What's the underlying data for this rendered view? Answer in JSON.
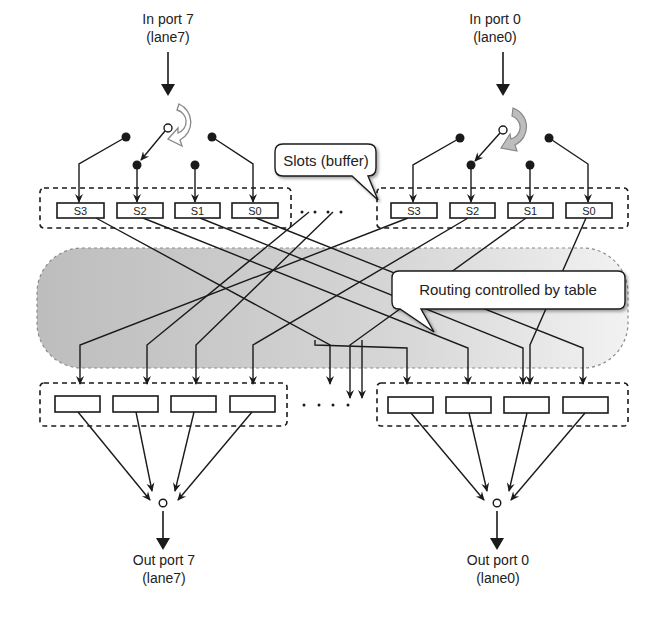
{
  "colors": {
    "line": "#1a1a1a",
    "routing_region": "#c9c9c9",
    "routing_region_border": "#8a8a8a",
    "rotation_arrow_light": "#ffffff",
    "rotation_arrow_dark": "#bdbdbd",
    "callout_fill": "#ffffff"
  },
  "inputs": [
    {
      "id": "in7",
      "label_line1": "In port 7",
      "label_line2": "(lane7)",
      "rotation_arrow": "outline"
    },
    {
      "id": "in0",
      "label_line1": "In port 0",
      "label_line2": "(lane0)",
      "rotation_arrow": "filled"
    }
  ],
  "outputs": [
    {
      "id": "out7",
      "label_line1": "Out port 7",
      "label_line2": "(lane7)"
    },
    {
      "id": "out0",
      "label_line1": "Out port 0",
      "label_line2": "(lane0)"
    }
  ],
  "input_slots": {
    "left": [
      "S3",
      "S2",
      "S1",
      "S0"
    ],
    "right": [
      "S3",
      "S2",
      "S1",
      "S0"
    ]
  },
  "output_slots": {
    "left": [
      "",
      "",
      "",
      ""
    ],
    "right": [
      "",
      "",
      "",
      ""
    ]
  },
  "ellipsis": "· · · ·",
  "callouts": {
    "slots": "Slots (buffer)",
    "routing": "Routing controlled by table"
  }
}
